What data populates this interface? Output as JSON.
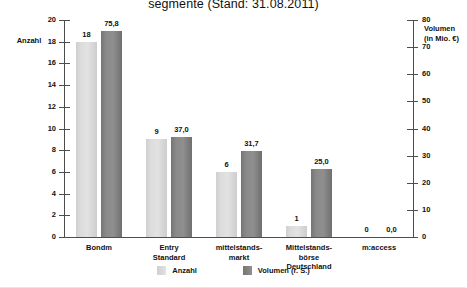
{
  "chart_data": {
    "type": "bar",
    "title": "segmente (Stand: 31.08.2011)",
    "xlabel": "",
    "ylabel": "Anzahl",
    "y2label": "Volumen (in Mio. €)",
    "grid": false,
    "legend_position": "bottom",
    "ylim": [
      0,
      20
    ],
    "y2lim": [
      0,
      80
    ],
    "yticks": [
      "0",
      "2",
      "4",
      "6",
      "8",
      "10",
      "12",
      "14",
      "16",
      "18",
      "20"
    ],
    "y2ticks": [
      "0",
      "10",
      "20",
      "30",
      "40",
      "50",
      "60",
      "70",
      "80"
    ],
    "categories": [
      "Bondm",
      "Entry\nStandard",
      "mittelstands-\nmarkt",
      "Mittelstands-\nbörse\nDeutschland",
      "m:access"
    ],
    "series": [
      {
        "name": "Anzahl",
        "axis": "left",
        "color": "#dcdcdc",
        "values": [
          18,
          9,
          6,
          1,
          0
        ],
        "labels": [
          "18",
          "9",
          "6",
          "1",
          "0"
        ]
      },
      {
        "name": "Volumen (r. S.)",
        "axis": "right",
        "color": "#868686",
        "values": [
          75.8,
          37.0,
          31.7,
          25.0,
          0.0
        ],
        "labels": [
          "75,8",
          "37,0",
          "31,7",
          "25,0",
          "0,0"
        ]
      }
    ]
  },
  "axes": {
    "left_title": "Anzahl",
    "right_title_line1": "Volumen",
    "right_title_line2": "(in Mio. €)"
  },
  "legend": {
    "items": [
      {
        "label": "Anzahl"
      },
      {
        "label": "Volumen (r. S.)"
      }
    ]
  }
}
